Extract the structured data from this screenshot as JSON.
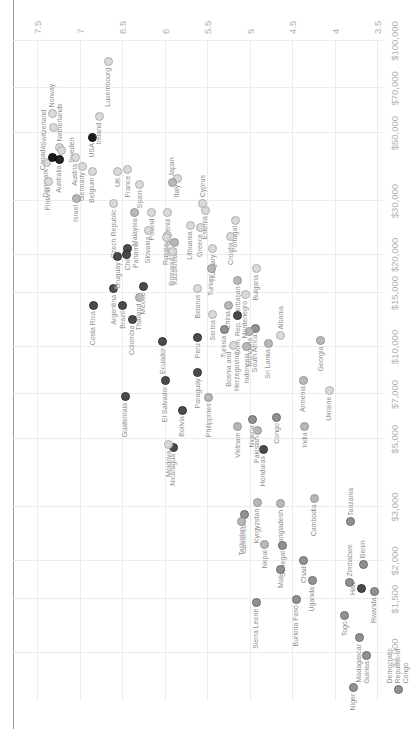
{
  "colors": {
    "gridline": "#ececec",
    "axis_tick_text": "#b0b0b0",
    "country_label_text": "#8f8f8f",
    "top_border_line": "#9a9a9a",
    "background": "#ffffff",
    "regions": {
      "na": {
        "fill": "#0f0f0f",
        "border": "#000000"
      },
      "oceania": {
        "fill": "#1a1a1a",
        "border": "#000000"
      },
      "americas": {
        "fill": "#424242",
        "border": "#262626"
      },
      "africa": {
        "fill": "#8c8c8c",
        "border": "#646464"
      },
      "asia": {
        "fill": "#b5b5b5",
        "border": "#909090"
      },
      "europe": {
        "fill": "#d9d9d9",
        "border": "#ababab"
      }
    }
  },
  "chart_data": {
    "type": "scatter",
    "orientation": "rendered rotated 90 degrees counter-clockwise (portrait screenshot of landscape chart)",
    "x_axis": {
      "scale": "log",
      "tick_values": [
        1000,
        1500,
        2000,
        3000,
        5000,
        7000,
        10000,
        15000,
        20000,
        30000,
        50000,
        70000,
        100000
      ],
      "tick_labels": [
        "$1,000",
        "$1,500",
        "$2,000",
        "$3,000",
        "$5,000",
        "$7,000",
        "$10,000",
        "$15,000",
        "$20,000",
        "$30,000",
        "$50,000",
        "$70,000",
        "$100,000"
      ]
    },
    "y_axis": {
      "tick_values": [
        7.5,
        7,
        6.5,
        6,
        5.5,
        5,
        4.5,
        4,
        3.5
      ],
      "tick_labels": [
        "7.5",
        "7",
        "6.5",
        "6",
        "5.5",
        "5",
        "4.5",
        "4",
        "3.5"
      ],
      "range": [
        3.0,
        7.8
      ]
    },
    "grid": true,
    "series": [
      {
        "name": "Norway",
        "region": "europe",
        "gdp": 58000,
        "ls": 7.32,
        "side": "right"
      },
      {
        "name": "Switzerland",
        "region": "europe",
        "gdp": 52000,
        "ls": 7.31,
        "side": "above"
      },
      {
        "name": "Denmark",
        "region": "europe",
        "gdp": 40000,
        "ls": 7.39,
        "side": "left"
      },
      {
        "name": "Finland",
        "region": "europe",
        "gdp": 34800,
        "ls": 7.37,
        "side": "left"
      },
      {
        "name": "Canada",
        "region": "na",
        "gdp": 41500,
        "ls": 7.32,
        "side": "above"
      },
      {
        "name": "Netherlands",
        "region": "europe",
        "gdp": 45000,
        "ls": 7.23,
        "side": "right"
      },
      {
        "name": "Sweden",
        "region": "europe",
        "gdp": 44000,
        "ls": 7.21,
        "side": "below"
      },
      {
        "name": "Australia",
        "region": "oceania",
        "gdp": 41000,
        "ls": 7.24,
        "side": "left"
      },
      {
        "name": "Austria",
        "region": "europe",
        "gdp": 41500,
        "ls": 7.05,
        "side": "left"
      },
      {
        "name": "Germany",
        "region": "europe",
        "gdp": 39000,
        "ls": 6.97,
        "side": "left"
      },
      {
        "name": "Belgium",
        "region": "europe",
        "gdp": 37500,
        "ls": 6.85,
        "side": "left"
      },
      {
        "name": "Israel",
        "region": "asia",
        "gdp": 30500,
        "ls": 7.04,
        "side": "left"
      },
      {
        "name": "USA",
        "region": "na",
        "gdp": 48500,
        "ls": 6.85,
        "side": "left"
      },
      {
        "name": "Ireland",
        "region": "europe",
        "gdp": 56500,
        "ls": 6.77,
        "side": "left"
      },
      {
        "name": "Luxembourg",
        "region": "europe",
        "gdp": 85500,
        "ls": 6.66,
        "side": "left"
      },
      {
        "name": "UK",
        "region": "europe",
        "gdp": 37500,
        "ls": 6.55,
        "side": "left"
      },
      {
        "name": "France",
        "region": "europe",
        "gdp": 38000,
        "ls": 6.43,
        "side": "left"
      },
      {
        "name": "Spain",
        "region": "europe",
        "gdp": 34000,
        "ls": 6.29,
        "side": "left"
      },
      {
        "name": "Czech Republic",
        "region": "europe",
        "gdp": 29500,
        "ls": 6.6,
        "side": "left"
      },
      {
        "name": "Italy",
        "region": "europe",
        "gdp": 35500,
        "ls": 5.85,
        "side": "left"
      },
      {
        "name": "Japan",
        "region": "asia",
        "gdp": 34500,
        "ls": 5.91,
        "side": "right"
      },
      {
        "name": "Slovenia",
        "region": "europe",
        "gdp": 27500,
        "ls": 5.96,
        "side": "left"
      },
      {
        "name": "Slovakia",
        "region": "europe",
        "gdp": 24000,
        "ls": 6.19,
        "side": "left"
      },
      {
        "name": "Poland",
        "region": "europe",
        "gdp": 27500,
        "ls": 6.15,
        "side": "left"
      },
      {
        "name": "Malaysia",
        "region": "asia",
        "gdp": 27500,
        "ls": 6.35,
        "side": "left"
      },
      {
        "name": "Estonia",
        "region": "europe",
        "gdp": 28000,
        "ls": 5.52,
        "side": "left"
      },
      {
        "name": "Greece",
        "region": "europe",
        "gdp": 24500,
        "ls": 5.58,
        "side": "left"
      },
      {
        "name": "Lithuania",
        "region": "europe",
        "gdp": 25000,
        "ls": 5.7,
        "side": "left"
      },
      {
        "name": "Latvia",
        "region": "europe",
        "gdp": 23200,
        "ls": 5.96,
        "side": "left"
      },
      {
        "name": "Russia",
        "region": "europe",
        "gdp": 22800,
        "ls": 5.98,
        "side": "left"
      },
      {
        "name": "Kazakhstan",
        "region": "asia",
        "gdp": 22000,
        "ls": 5.88,
        "side": "left"
      },
      {
        "name": "Romania",
        "region": "europe",
        "gdp": 20500,
        "ls": 5.91,
        "side": "left"
      },
      {
        "name": "Hungary",
        "region": "europe",
        "gdp": 21000,
        "ls": 5.43,
        "side": "left"
      },
      {
        "name": "Turkey",
        "region": "asia",
        "gdp": 18000,
        "ls": 5.45,
        "side": "left"
      },
      {
        "name": "Croatia",
        "region": "europe",
        "gdp": 23000,
        "ls": 5.22,
        "side": "left"
      },
      {
        "name": "Portugal",
        "region": "europe",
        "gdp": 26000,
        "ls": 5.17,
        "side": "left"
      },
      {
        "name": "Cyprus",
        "region": "europe",
        "gdp": 29500,
        "ls": 5.55,
        "side": "right"
      },
      {
        "name": "Bulgaria",
        "region": "europe",
        "gdp": 18000,
        "ls": 4.92,
        "side": "left"
      },
      {
        "name": "Montenegro",
        "region": "europe",
        "gdp": 14800,
        "ls": 5.05,
        "side": "left"
      },
      {
        "name": "Azerbaijan",
        "region": "asia",
        "gdp": 16500,
        "ls": 5.14,
        "side": "left"
      },
      {
        "name": "Serbia",
        "region": "europe",
        "gdp": 12800,
        "ls": 5.43,
        "side": "left"
      },
      {
        "name": "Belarus",
        "region": "europe",
        "gdp": 15500,
        "ls": 5.61,
        "side": "left"
      },
      {
        "name": "China",
        "region": "asia",
        "gdp": 13700,
        "ls": 5.25,
        "side": "left"
      },
      {
        "name": "Thailand",
        "region": "asia",
        "gdp": 14500,
        "ls": 6.3,
        "side": "left"
      },
      {
        "name": "Mexico",
        "region": "americas",
        "gdp": 15800,
        "ls": 6.25,
        "side": "left"
      },
      {
        "name": "Argentina",
        "region": "americas",
        "gdp": 15500,
        "ls": 6.6,
        "side": "left"
      },
      {
        "name": "Chile",
        "region": "americas",
        "gdp": 21000,
        "ls": 6.43,
        "side": "left"
      },
      {
        "name": "Uruguay",
        "region": "americas",
        "gdp": 19800,
        "ls": 6.55,
        "side": "left"
      },
      {
        "name": "Panama",
        "region": "americas",
        "gdp": 20000,
        "ls": 6.45,
        "side": "below"
      },
      {
        "name": "Costa Rica",
        "region": "americas",
        "gdp": 13700,
        "ls": 6.84,
        "side": "left"
      },
      {
        "name": "Brazil",
        "region": "americas",
        "gdp": 13700,
        "ls": 6.49,
        "side": "left"
      },
      {
        "name": "Colombia",
        "region": "americas",
        "gdp": 12300,
        "ls": 6.38,
        "side": "left"
      },
      {
        "name": "Ecuador",
        "region": "americas",
        "gdp": 10400,
        "ls": 6.02,
        "side": "left"
      },
      {
        "name": "Peru",
        "region": "americas",
        "gdp": 10750,
        "ls": 5.61,
        "side": "left"
      },
      {
        "name": "El Salvador",
        "region": "americas",
        "gdp": 7780,
        "ls": 5.99,
        "side": "left"
      },
      {
        "name": "Paraguay",
        "region": "americas",
        "gdp": 8260,
        "ls": 5.61,
        "side": "left"
      },
      {
        "name": "Guatemala",
        "region": "americas",
        "gdp": 6870,
        "ls": 6.46,
        "side": "left"
      },
      {
        "name": "Bolivia",
        "region": "americas",
        "gdp": 6220,
        "ls": 5.79,
        "side": "left"
      },
      {
        "name": "Nicaragua",
        "region": "americas",
        "gdp": 4680,
        "ls": 5.9,
        "side": "left"
      },
      {
        "name": "Honduras",
        "region": "americas",
        "gdp": 4610,
        "ls": 4.84,
        "side": "left"
      },
      {
        "name": "Dom. Rep.",
        "region": "americas",
        "gdp": 12700,
        "ls": 5.14,
        "side": "left"
      },
      {
        "name": "Haiti",
        "region": "americas",
        "gdp": 1630,
        "ls": 3.68,
        "side": "above"
      },
      {
        "name": "Moldova",
        "region": "europe",
        "gdp": 4800,
        "ls": 5.95,
        "side": "left"
      },
      {
        "name": "Ukraine",
        "region": "europe",
        "gdp": 7200,
        "ls": 4.06,
        "side": "left"
      },
      {
        "name": "Tunisia",
        "region": "africa",
        "gdp": 11400,
        "ls": 5.3,
        "side": "left"
      },
      {
        "name": "South Africa",
        "region": "africa",
        "gdp": 11500,
        "ls": 4.93,
        "side": "left"
      },
      {
        "name": "Mongolia",
        "region": "asia",
        "gdp": 11200,
        "ls": 5.0,
        "side": "left"
      },
      {
        "name": "Bosnia and\nHerzegovina",
        "region": "europe",
        "gdp": 10100,
        "ls": 5.19,
        "side": "left"
      },
      {
        "name": "Indonesia",
        "region": "asia",
        "gdp": 10000,
        "ls": 5.03,
        "side": "left"
      },
      {
        "name": "Sri Lanka",
        "region": "asia",
        "gdp": 10300,
        "ls": 4.78,
        "side": "left"
      },
      {
        "name": "Albania",
        "region": "europe",
        "gdp": 10900,
        "ls": 4.63,
        "side": "right"
      },
      {
        "name": "Georgia",
        "region": "asia",
        "gdp": 10500,
        "ls": 4.16,
        "side": "left"
      },
      {
        "name": "Armenia",
        "region": "asia",
        "gdp": 7800,
        "ls": 4.37,
        "side": "left"
      },
      {
        "name": "Philippines",
        "region": "asia",
        "gdp": 6850,
        "ls": 5.48,
        "side": "left"
      },
      {
        "name": "Vietnam",
        "region": "asia",
        "gdp": 5500,
        "ls": 5.14,
        "side": "left"
      },
      {
        "name": "India",
        "region": "asia",
        "gdp": 5500,
        "ls": 4.35,
        "side": "left"
      },
      {
        "name": "Pakistan",
        "region": "asia",
        "gdp": 5350,
        "ls": 4.91,
        "side": "left"
      },
      {
        "name": "Nigeria",
        "region": "africa",
        "gdp": 5800,
        "ls": 4.97,
        "side": "left"
      },
      {
        "name": "Congo",
        "region": "africa",
        "gdp": 5900,
        "ls": 4.68,
        "side": "left"
      },
      {
        "name": "Cameroon",
        "region": "africa",
        "gdp": 2830,
        "ls": 5.06,
        "side": "left"
      },
      {
        "name": "Kyrgyzstan",
        "region": "asia",
        "gdp": 3100,
        "ls": 4.91,
        "side": "left"
      },
      {
        "name": "Bangladesh",
        "region": "asia",
        "gdp": 3070,
        "ls": 4.63,
        "side": "left"
      },
      {
        "name": "Cambodia",
        "region": "asia",
        "gdp": 3200,
        "ls": 4.24,
        "side": "left"
      },
      {
        "name": "Tajikistan",
        "region": "asia",
        "gdp": 2700,
        "ls": 5.09,
        "side": "left"
      },
      {
        "name": "Nepal",
        "region": "asia",
        "gdp": 2270,
        "ls": 4.82,
        "side": "left"
      },
      {
        "name": "Tanzania",
        "region": "africa",
        "gdp": 2680,
        "ls": 3.81,
        "side": "right"
      },
      {
        "name": "Senegal",
        "region": "africa",
        "gdp": 2250,
        "ls": 4.61,
        "side": "left"
      },
      {
        "name": "Mali",
        "region": "africa",
        "gdp": 1880,
        "ls": 4.63,
        "side": "left"
      },
      {
        "name": "Chad",
        "region": "africa",
        "gdp": 2010,
        "ls": 4.36,
        "side": "left"
      },
      {
        "name": "Uganda",
        "region": "africa",
        "gdp": 1720,
        "ls": 4.26,
        "side": "left"
      },
      {
        "name": "Burkina Faso",
        "region": "africa",
        "gdp": 1500,
        "ls": 4.45,
        "side": "left"
      },
      {
        "name": "Sierra Leone",
        "region": "africa",
        "gdp": 1460,
        "ls": 4.92,
        "side": "left"
      },
      {
        "name": "Zimbabwe",
        "region": "africa",
        "gdp": 1700,
        "ls": 3.82,
        "side": "right"
      },
      {
        "name": "Benin",
        "region": "africa",
        "gdp": 1950,
        "ls": 3.66,
        "side": "right"
      },
      {
        "name": "Rwanda",
        "region": "africa",
        "gdp": 1590,
        "ls": 3.53,
        "side": "left"
      },
      {
        "name": "Togo",
        "region": "africa",
        "gdp": 1330,
        "ls": 3.88,
        "side": "left"
      },
      {
        "name": "Madagascar",
        "region": "africa",
        "gdp": 1120,
        "ls": 3.71,
        "side": "left"
      },
      {
        "name": "Guinea",
        "region": "africa",
        "gdp": 985,
        "ls": 3.62,
        "side": "left"
      },
      {
        "name": "Niger",
        "region": "africa",
        "gdp": 770,
        "ls": 3.78,
        "side": "left"
      },
      {
        "name": "Democratic\nRepublic of\nCongo",
        "region": "africa",
        "gdp": 760,
        "ls": 3.25,
        "side": "right"
      }
    ]
  }
}
